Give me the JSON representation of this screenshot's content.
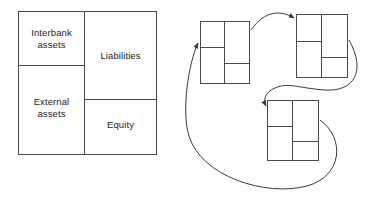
{
  "figure": {
    "background_color": "#ffffff",
    "line_color": "#4a4a4a",
    "text_color": "#1c1c1c"
  },
  "balance_sheet": {
    "name": "bank-balance-sheet",
    "assets": {
      "interbank_label": "Interbank\nassets",
      "external_label": "External\nassets"
    },
    "liabilities_side": {
      "liabilities_label": "Liabilities",
      "equity_label": "Equity"
    }
  },
  "network": {
    "name": "interbank-network",
    "nodes": [
      {
        "id": "bank-1",
        "position": "top-left"
      },
      {
        "id": "bank-2",
        "position": "top-right"
      },
      {
        "id": "bank-3",
        "position": "bottom-center"
      }
    ],
    "edges": [
      {
        "from": "bank-1",
        "to": "bank-2",
        "style": "curved-arrow"
      },
      {
        "from": "bank-2",
        "to": "bank-3",
        "style": "curved-arrow"
      },
      {
        "from": "bank-3",
        "to": "bank-1",
        "style": "curved-arrow"
      }
    ]
  }
}
